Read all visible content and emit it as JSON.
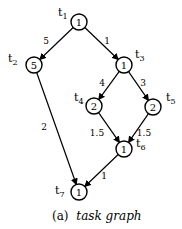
{
  "nodes": [
    {
      "id": "t1",
      "label": "t",
      "sub": "1",
      "weight": "1",
      "x": 79,
      "y": 22,
      "lx": 58,
      "ly": 16
    },
    {
      "id": "t2",
      "label": "t",
      "sub": "2",
      "weight": "5",
      "x": 34,
      "y": 65,
      "lx": 8,
      "ly": 62
    },
    {
      "id": "t3",
      "label": "t",
      "sub": "3",
      "weight": "1",
      "x": 124,
      "y": 65,
      "lx": 135,
      "ly": 58
    },
    {
      "id": "t4",
      "label": "t",
      "sub": "4",
      "weight": "2",
      "x": 94,
      "y": 106,
      "lx": 74,
      "ly": 101
    },
    {
      "id": "t5",
      "label": "t",
      "sub": "5",
      "weight": "2",
      "x": 153,
      "y": 107,
      "lx": 166,
      "ly": 101
    },
    {
      "id": "t6",
      "label": "t",
      "sub": "6",
      "weight": "1",
      "x": 124,
      "y": 149,
      "lx": 136,
      "ly": 147
    },
    {
      "id": "t7",
      "label": "t",
      "sub": "7",
      "weight": "1",
      "x": 79,
      "y": 192,
      "lx": 55,
      "ly": 194
    }
  ],
  "edges": [
    {
      "from": "t1",
      "to": "t2",
      "weight": "5",
      "wx": 46,
      "wy": 44
    },
    {
      "from": "t1",
      "to": "t3",
      "weight": "1",
      "wx": 107,
      "wy": 44
    },
    {
      "from": "t3",
      "to": "t4",
      "weight": "4",
      "wx": 102,
      "wy": 86
    },
    {
      "from": "t3",
      "to": "t5",
      "weight": "3",
      "wx": 143,
      "wy": 86
    },
    {
      "from": "t4",
      "to": "t6",
      "weight": "1.5",
      "wx": 97,
      "wy": 136
    },
    {
      "from": "t5",
      "to": "t6",
      "weight": "1.5",
      "wx": 144,
      "wy": 136
    },
    {
      "from": "t2",
      "to": "t7",
      "weight": "2",
      "wx": 44,
      "wy": 130
    },
    {
      "from": "t6",
      "to": "t7",
      "weight": "1",
      "wx": 104,
      "wy": 179
    }
  ],
  "caption": {
    "prefix": "(a)",
    "text": "task graph"
  }
}
